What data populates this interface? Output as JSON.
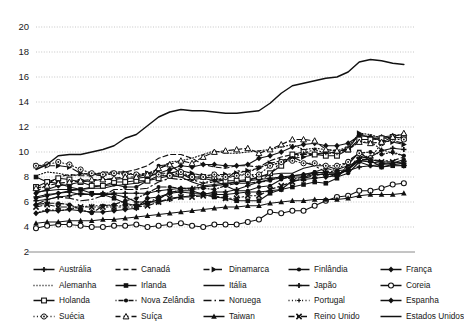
{
  "chart_data": {
    "type": "line",
    "title": "",
    "xlabel": "",
    "ylabel": "",
    "xlim": [
      1980,
      2014
    ],
    "ylim": [
      2,
      20
    ],
    "grid": true,
    "legend_position": "bottom",
    "xticks": [
      "1980",
      "1983",
      "1986",
      "1989",
      "1992",
      "1995",
      "1998",
      "2001",
      "2004",
      "2007",
      "2010",
      "2013"
    ],
    "yticks": [
      "2",
      "4",
      "6",
      "8",
      "10",
      "12",
      "14",
      "16",
      "18",
      "20"
    ],
    "x": [
      1980,
      1981,
      1982,
      1983,
      1984,
      1985,
      1986,
      1987,
      1988,
      1989,
      1990,
      1991,
      1992,
      1993,
      1994,
      1995,
      1996,
      1997,
      1998,
      1999,
      2000,
      2001,
      2002,
      2003,
      2004,
      2005,
      2006,
      2007,
      2008,
      2009,
      2010,
      2011,
      2012,
      2013
    ],
    "series": [
      {
        "name": "Austrália",
        "marker": "plus",
        "dash": "solid",
        "values": [
          6.1,
          6.2,
          6.4,
          6.5,
          6.7,
          6.6,
          6.7,
          6.7,
          6.7,
          6.7,
          6.7,
          6.9,
          7.0,
          7.1,
          7.1,
          7.2,
          7.3,
          7.4,
          7.6,
          7.7,
          7.8,
          7.9,
          8.0,
          8.1,
          8.2,
          8.3,
          8.4,
          8.3,
          8.5,
          8.8,
          8.9,
          8.8,
          9.0,
          9.1
        ]
      },
      {
        "name": "Canadá",
        "marker": "none",
        "dash": "dash",
        "values": [
          6.8,
          7.4,
          8.0,
          8.2,
          8.1,
          8.1,
          8.4,
          8.4,
          8.4,
          8.6,
          8.9,
          9.5,
          9.8,
          9.8,
          9.5,
          9.0,
          8.8,
          8.7,
          8.9,
          8.9,
          8.8,
          9.3,
          9.6,
          9.8,
          9.8,
          9.8,
          10.0,
          10.0,
          10.3,
          11.4,
          11.2,
          10.9,
          10.9,
          10.7
        ]
      },
      {
        "name": "Dinamarca",
        "marker": "triangle-r",
        "dash": "dashdot",
        "values": [
          8.9,
          8.9,
          8.9,
          8.8,
          8.3,
          8.2,
          8.1,
          8.3,
          8.3,
          8.2,
          8.3,
          8.3,
          8.3,
          8.5,
          8.3,
          8.1,
          8.2,
          8.2,
          8.3,
          8.5,
          8.7,
          9.1,
          9.3,
          9.5,
          9.6,
          9.8,
          9.9,
          10.0,
          10.2,
          11.5,
          11.1,
          10.9,
          10.8,
          10.6
        ]
      },
      {
        "name": "Finlândia",
        "marker": "circle-sm",
        "dash": "solid",
        "values": [
          6.3,
          6.5,
          6.7,
          6.9,
          7.0,
          7.2,
          7.3,
          7.4,
          7.2,
          7.2,
          7.7,
          8.9,
          9.0,
          8.3,
          7.8,
          7.9,
          7.7,
          7.3,
          6.9,
          6.9,
          7.2,
          7.3,
          7.8,
          8.1,
          8.2,
          8.4,
          8.3,
          8.0,
          8.3,
          9.2,
          8.9,
          9.0,
          9.1,
          9.4
        ]
      },
      {
        "name": "França",
        "marker": "diamond",
        "dash": "solid",
        "values": [
          6.7,
          7.0,
          7.3,
          7.4,
          7.6,
          7.7,
          7.8,
          7.8,
          7.9,
          7.9,
          8.0,
          8.3,
          8.6,
          8.9,
          8.8,
          9.0,
          9.0,
          8.9,
          8.9,
          9.0,
          9.5,
          9.7,
          10.0,
          10.4,
          10.6,
          10.7,
          10.5,
          10.5,
          10.7,
          11.3,
          11.2,
          11.2,
          11.3,
          11.4
        ]
      },
      {
        "name": "Alemanha",
        "marker": "none",
        "dash": "dot",
        "values": [
          8.1,
          8.4,
          8.3,
          8.1,
          8.2,
          8.3,
          8.3,
          8.4,
          8.4,
          8.1,
          8.3,
          8.6,
          9.2,
          9.3,
          9.5,
          9.8,
          10.1,
          9.9,
          9.9,
          10.0,
          10.1,
          10.2,
          10.4,
          10.6,
          10.2,
          10.3,
          10.2,
          10.1,
          10.4,
          11.5,
          11.4,
          11.1,
          11.1,
          11.2
        ]
      },
      {
        "name": "Irlanda",
        "marker": "square",
        "dash": "solid",
        "values": [
          8.0,
          7.6,
          7.5,
          7.2,
          7.0,
          6.7,
          6.6,
          6.3,
          5.9,
          5.7,
          5.9,
          6.2,
          6.8,
          6.9,
          6.9,
          6.6,
          6.4,
          6.3,
          6.1,
          6.1,
          6.1,
          6.7,
          7.0,
          7.2,
          7.4,
          7.6,
          7.5,
          7.9,
          9.0,
          10.0,
          9.3,
          8.8,
          8.9,
          8.9
        ]
      },
      {
        "name": "Itália",
        "marker": "none",
        "dash": "solid",
        "values": [
          6.8,
          6.9,
          7.0,
          7.0,
          7.0,
          7.1,
          7.1,
          7.3,
          7.4,
          7.5,
          7.7,
          8.1,
          8.1,
          8.0,
          7.6,
          7.3,
          7.4,
          7.5,
          7.6,
          7.7,
          8.0,
          8.2,
          8.3,
          8.3,
          8.7,
          8.9,
          8.9,
          8.6,
          8.9,
          9.3,
          9.4,
          9.2,
          9.2,
          9.1
        ]
      },
      {
        "name": "Japão",
        "marker": "plus",
        "dash": "solid",
        "values": [
          6.4,
          6.6,
          6.7,
          6.8,
          6.6,
          6.6,
          6.6,
          6.6,
          6.4,
          6.0,
          6.0,
          6.0,
          6.2,
          6.4,
          6.5,
          6.6,
          6.8,
          6.8,
          7.0,
          7.3,
          7.6,
          7.8,
          7.9,
          8.0,
          8.0,
          8.2,
          8.2,
          8.2,
          8.6,
          9.5,
          9.6,
          10.1,
          10.3,
          10.2
        ]
      },
      {
        "name": "Coreia",
        "marker": "circle-open",
        "dash": "solid",
        "values": [
          3.9,
          4.1,
          4.2,
          4.2,
          4.1,
          4.0,
          4.0,
          4.1,
          4.1,
          4.2,
          4.0,
          4.1,
          4.2,
          4.3,
          4.1,
          4.0,
          4.2,
          4.2,
          4.2,
          4.4,
          4.6,
          5.2,
          5.1,
          5.3,
          5.3,
          5.7,
          6.1,
          6.4,
          6.5,
          6.9,
          6.9,
          7.1,
          7.4,
          7.5
        ]
      },
      {
        "name": "Holanda",
        "marker": "square-open",
        "dash": "solid",
        "values": [
          7.2,
          7.6,
          7.9,
          7.8,
          7.6,
          7.3,
          7.3,
          7.6,
          7.6,
          7.7,
          7.7,
          7.9,
          8.1,
          8.2,
          8.0,
          8.0,
          7.9,
          7.7,
          7.7,
          7.8,
          8.0,
          8.3,
          8.9,
          9.8,
          10.0,
          9.8,
          9.7,
          9.7,
          10.2,
          11.0,
          11.0,
          11.1,
          11.2,
          11.1
        ]
      },
      {
        "name": "Nova Zelândia",
        "marker": "circle-sm",
        "dash": "dotdash",
        "values": [
          5.8,
          5.9,
          5.9,
          5.8,
          5.4,
          5.1,
          5.7,
          5.8,
          6.1,
          6.3,
          6.7,
          7.2,
          7.2,
          7.1,
          7.0,
          7.1,
          7.0,
          7.3,
          7.5,
          7.5,
          7.6,
          7.7,
          8.1,
          7.8,
          8.0,
          8.4,
          8.7,
          8.5,
          9.3,
          9.9,
          10.0,
          9.8,
          10.0,
          9.7
        ]
      },
      {
        "name": "Noruega",
        "marker": "none",
        "dash": "longdashdot",
        "values": [
          5.8,
          6.2,
          6.4,
          6.3,
          6.1,
          6.2,
          6.5,
          7.0,
          7.0,
          7.0,
          7.1,
          7.6,
          7.9,
          7.8,
          7.8,
          7.5,
          7.6,
          7.8,
          8.5,
          8.4,
          7.7,
          8.2,
          9.3,
          9.6,
          9.2,
          8.9,
          8.4,
          8.5,
          8.6,
          9.7,
          9.4,
          9.3,
          9.3,
          9.6
        ]
      },
      {
        "name": "Portugal",
        "marker": "plus-sm",
        "dash": "dotdot",
        "values": [
          5.1,
          5.4,
          5.3,
          5.4,
          5.6,
          5.7,
          5.7,
          5.7,
          5.7,
          5.8,
          5.9,
          6.4,
          6.6,
          7.1,
          7.1,
          7.5,
          7.8,
          7.9,
          8.1,
          8.3,
          8.8,
          9.0,
          9.1,
          9.5,
          9.9,
          10.2,
          9.9,
          9.9,
          10.2,
          10.8,
          10.8,
          10.2,
          9.9,
          9.7
        ]
      },
      {
        "name": "Espanha",
        "marker": "diamond",
        "dash": "solid",
        "values": [
          5.1,
          5.3,
          5.3,
          5.4,
          5.3,
          5.2,
          5.2,
          5.3,
          5.4,
          5.5,
          6.3,
          6.4,
          6.7,
          6.8,
          6.7,
          6.7,
          6.6,
          6.6,
          6.7,
          6.8,
          6.8,
          6.9,
          7.0,
          7.7,
          7.8,
          7.9,
          8.0,
          8.1,
          8.6,
          9.3,
          9.2,
          9.1,
          9.0,
          8.9
        ]
      },
      {
        "name": "Suécia",
        "marker": "circle-dot",
        "dash": "dotdot",
        "values": [
          8.9,
          9.0,
          9.2,
          9.0,
          8.6,
          8.3,
          8.2,
          8.3,
          8.2,
          8.2,
          8.2,
          8.2,
          8.1,
          8.4,
          8.0,
          8.0,
          8.2,
          8.0,
          8.1,
          8.2,
          8.2,
          8.9,
          9.2,
          9.3,
          9.1,
          9.1,
          8.9,
          8.9,
          9.2,
          9.9,
          9.5,
          10.7,
          11.0,
          11.0
        ]
      },
      {
        "name": "Suíça",
        "marker": "triangle-open",
        "dash": "dash",
        "values": [
          7.1,
          7.3,
          7.5,
          7.6,
          7.7,
          7.8,
          7.8,
          7.9,
          8.0,
          8.0,
          8.2,
          8.7,
          9.0,
          9.3,
          9.1,
          9.6,
          10.0,
          10.1,
          10.2,
          10.3,
          9.9,
          10.2,
          10.6,
          11.0,
          11.0,
          10.9,
          10.2,
          10.1,
          10.2,
          10.8,
          10.7,
          10.8,
          11.2,
          11.5
        ]
      },
      {
        "name": "Taiwan",
        "marker": "triangle-up",
        "dash": "solid",
        "values": [
          4.3,
          4.4,
          4.4,
          4.5,
          4.5,
          4.5,
          4.6,
          4.6,
          4.7,
          4.8,
          4.9,
          5.0,
          5.1,
          5.2,
          5.3,
          5.4,
          5.5,
          5.6,
          5.6,
          5.7,
          5.7,
          5.9,
          6.0,
          6.1,
          6.1,
          6.2,
          6.2,
          6.2,
          6.3,
          6.5,
          6.6,
          6.6,
          6.6,
          6.7
        ]
      },
      {
        "name": "Reino Unido",
        "marker": "cross",
        "dash": "dashdot",
        "values": [
          5.6,
          5.8,
          5.6,
          5.6,
          5.6,
          5.6,
          5.6,
          5.6,
          5.6,
          5.6,
          5.7,
          6.0,
          6.3,
          6.4,
          6.4,
          6.5,
          6.5,
          6.3,
          6.3,
          6.5,
          6.5,
          7.0,
          7.3,
          7.6,
          7.9,
          8.1,
          8.3,
          8.3,
          8.6,
          9.4,
          9.4,
          9.2,
          9.2,
          9.1
        ]
      },
      {
        "name": "Estados Unidos",
        "marker": "none",
        "dash": "solid",
        "values": [
          8.6,
          9.0,
          9.7,
          9.8,
          9.8,
          10.0,
          10.2,
          10.5,
          11.1,
          11.4,
          12.1,
          12.8,
          13.2,
          13.4,
          13.3,
          13.3,
          13.2,
          13.1,
          13.1,
          13.2,
          13.3,
          13.9,
          14.7,
          15.3,
          15.5,
          15.7,
          15.9,
          16.0,
          16.4,
          17.2,
          17.4,
          17.3,
          17.1,
          17.0
        ]
      }
    ]
  },
  "legend": {
    "rows": [
      [
        {
          "label": "Austrália",
          "marker": "plus",
          "dash": "solid"
        },
        {
          "label": "Canadá",
          "marker": "none",
          "dash": "dash"
        },
        {
          "label": "Dinamarca",
          "marker": "triangle-r",
          "dash": "dashdot"
        },
        {
          "label": "Finlândia",
          "marker": "circle-sm",
          "dash": "solid"
        },
        {
          "label": "França",
          "marker": "diamond",
          "dash": "solid"
        }
      ],
      [
        {
          "label": "Alemanha",
          "marker": "none",
          "dash": "dot"
        },
        {
          "label": "Irlanda",
          "marker": "square",
          "dash": "solid"
        },
        {
          "label": "Itália",
          "marker": "none",
          "dash": "solid"
        },
        {
          "label": "Japão",
          "marker": "plus",
          "dash": "solid"
        },
        {
          "label": "Coreia",
          "marker": "circle-open",
          "dash": "solid"
        }
      ],
      [
        {
          "label": "Holanda",
          "marker": "square-open",
          "dash": "solid"
        },
        {
          "label": "Nova Zelândia",
          "marker": "circle-sm",
          "dash": "dotdash"
        },
        {
          "label": "Noruega",
          "marker": "none",
          "dash": "longdashdot"
        },
        {
          "label": "Portugal",
          "marker": "plus-sm",
          "dash": "dotdot"
        },
        {
          "label": "Espanha",
          "marker": "diamond",
          "dash": "solid"
        }
      ],
      [
        {
          "label": "Suécia",
          "marker": "circle-dot",
          "dash": "dotdot"
        },
        {
          "label": "Suíça",
          "marker": "triangle-open",
          "dash": "dash"
        },
        {
          "label": "Taiwan",
          "marker": "triangle-up",
          "dash": "solid"
        },
        {
          "label": "Reino Unido",
          "marker": "cross",
          "dash": "dashdot"
        },
        {
          "label": "Estados Unidos",
          "marker": "none",
          "dash": "solid"
        }
      ]
    ]
  },
  "colors": {
    "line": "#111111",
    "grid": "#bfbfbf",
    "axis": "#8a8a8a",
    "text": "#1b1b1b",
    "background": "#ffffff"
  }
}
